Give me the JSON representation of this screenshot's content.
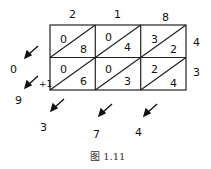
{
  "top_digits": [
    "2",
    "1",
    "8"
  ],
  "right_digits": [
    "4",
    "3"
  ],
  "cells": [
    [
      {
        "tens": "0",
        "ones": "8"
      },
      {
        "tens": "0",
        "ones": "4"
      },
      {
        "tens": "3",
        "ones": "2"
      }
    ],
    [
      {
        "tens": "0",
        "ones": "6"
      },
      {
        "tens": "0",
        "ones": "3"
      },
      {
        "tens": "2",
        "ones": "4"
      }
    ]
  ],
  "left_results": [
    "0",
    "9"
  ],
  "bottom_results": [
    "3",
    "7",
    "4"
  ],
  "carry_label": "+1",
  "caption": "图 1.11"
}
